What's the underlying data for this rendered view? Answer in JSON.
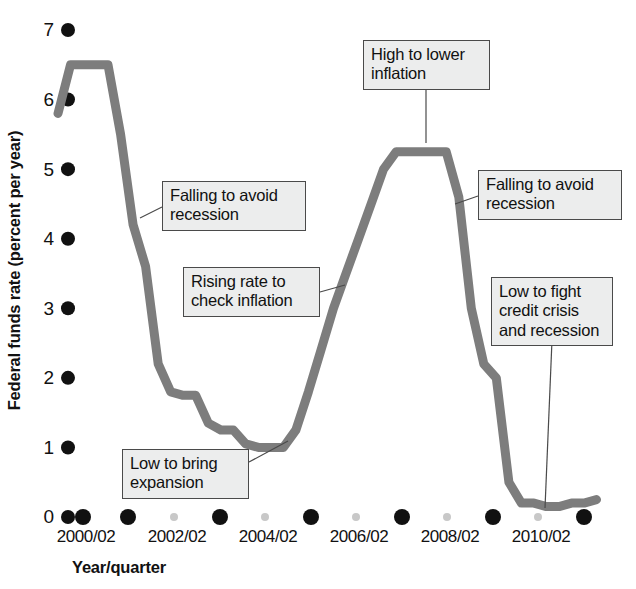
{
  "chart_data": {
    "type": "line",
    "title": "",
    "xlabel": "Year/quarter",
    "ylabel": "Federal funds rate (percent per year)",
    "ylim": [
      0,
      7
    ],
    "ytick_labels": [
      "0",
      "1",
      "2",
      "3",
      "4",
      "5",
      "6",
      "7"
    ],
    "ytick_values": [
      0,
      1,
      2,
      3,
      4,
      5,
      6,
      7
    ],
    "xtick_labels": [
      "2000/02",
      "2002/02",
      "2004/02",
      "2006/02",
      "2008/02",
      "2010/02"
    ],
    "xtick_values": [
      2000.25,
      2002.25,
      2004.25,
      2006.25,
      2008.25,
      2010.25
    ],
    "grid": false,
    "legend": null,
    "series": [
      {
        "name": "Federal funds rate",
        "color": "#7d7d7d",
        "x": [
          1999.75,
          2000.0,
          2000.25,
          2000.5,
          2000.75,
          2001.0,
          2001.25,
          2001.5,
          2001.75,
          2002.0,
          2002.25,
          2002.5,
          2002.75,
          2003.0,
          2003.25,
          2003.5,
          2003.75,
          2004.0,
          2004.25,
          2004.5,
          2004.75,
          2005.0,
          2005.25,
          2005.5,
          2005.75,
          2006.0,
          2006.25,
          2006.5,
          2006.75,
          2007.0,
          2007.25,
          2007.5,
          2007.75,
          2008.0,
          2008.25,
          2008.5,
          2008.75,
          2009.0,
          2009.25,
          2009.5,
          2009.75,
          2010.0,
          2010.25,
          2010.5
        ],
        "y": [
          5.8,
          6.5,
          6.5,
          6.5,
          6.5,
          5.5,
          4.2,
          3.6,
          2.2,
          1.8,
          1.75,
          1.75,
          1.35,
          1.25,
          1.25,
          1.05,
          1.0,
          1.0,
          1.0,
          1.25,
          1.8,
          2.4,
          3.0,
          3.5,
          4.0,
          4.5,
          5.0,
          5.25,
          5.25,
          5.25,
          5.25,
          5.25,
          4.6,
          3.0,
          2.2,
          2.0,
          0.5,
          0.2,
          0.2,
          0.15,
          0.15,
          0.2,
          0.2,
          0.25
        ]
      }
    ],
    "annotations": [
      {
        "id": "falling-to-avoid-recession-1",
        "text_lines": [
          "Falling to avoid",
          "recession"
        ],
        "points_to_x": 2001.15,
        "points_to_y": 4.55
      },
      {
        "id": "rising-rate-to-check-inflation",
        "text_lines": [
          "Rising rate to",
          "check inflation"
        ],
        "points_to_x": 2005.1,
        "points_to_y": 2.8
      },
      {
        "id": "high-to-lower-inflation",
        "text_lines": [
          "High to lower",
          "inflation"
        ],
        "points_to_x": 2006.55,
        "points_to_y": 5.3
      },
      {
        "id": "falling-to-avoid-recession-2",
        "text_lines": [
          "Falling to avoid",
          "recession"
        ],
        "points_to_x": 2007.95,
        "points_to_y": 4.45
      },
      {
        "id": "low-to-fight-credit-crisis-and-recession",
        "text_lines": [
          "Low to fight",
          "credit crisis",
          "and recession"
        ],
        "points_to_x": 2009.6,
        "points_to_y": 0.18
      },
      {
        "id": "low-to-bring-expansion",
        "text_lines": [
          "Low to bring",
          "expansion"
        ],
        "points_to_x": 2004.05,
        "points_to_y": 1.0
      }
    ]
  },
  "axes": {
    "y_ticks": [
      {
        "label": "7",
        "top": 19
      },
      {
        "label": "6",
        "top": 89
      },
      {
        "label": "5",
        "top": 159
      },
      {
        "label": "4",
        "top": 228
      },
      {
        "label": "3",
        "top": 298
      },
      {
        "label": "2",
        "top": 367
      },
      {
        "label": "1",
        "top": 437
      },
      {
        "label": "0",
        "top": 506
      }
    ],
    "x_ticks": [
      {
        "label": "2000/02",
        "left": 38
      },
      {
        "label": "2002/02",
        "left": 129
      },
      {
        "label": "2004/02",
        "left": 220
      },
      {
        "label": "2006/02",
        "left": 311
      },
      {
        "label": "2008/02",
        "left": 402
      },
      {
        "label": "2010/02",
        "left": 493
      }
    ]
  },
  "annotation_boxes": [
    {
      "id": "falling-to-avoid-recession-1",
      "left": 162,
      "top": 181,
      "width": 144,
      "lines": [
        "Falling to avoid",
        "recession"
      ]
    },
    {
      "id": "rising-rate-to-check-inflation",
      "left": 183,
      "top": 267,
      "width": 137,
      "lines": [
        "Rising rate to",
        "check inflation"
      ]
    },
    {
      "id": "high-to-lower-inflation",
      "left": 363,
      "top": 40,
      "width": 127,
      "lines": [
        "High to lower",
        "inflation"
      ]
    },
    {
      "id": "falling-to-avoid-recession-2",
      "left": 478,
      "top": 170,
      "width": 144,
      "lines": [
        "Falling to avoid",
        "recession"
      ]
    },
    {
      "id": "low-to-fight-credit-crisis-and-recession",
      "left": 491,
      "top": 277,
      "width": 122,
      "lines": [
        "Low to fight",
        "credit crisis",
        "and recession"
      ]
    },
    {
      "id": "low-to-bring-expansion",
      "left": 122,
      "top": 449,
      "width": 127,
      "lines": [
        "Low to bring",
        "expansion"
      ]
    }
  ],
  "leader_lines": [
    {
      "id": "leader-falling-1",
      "x1": 162,
      "y1": 207,
      "x2": 140,
      "y2": 218
    },
    {
      "id": "leader-rising",
      "x1": 320,
      "y1": 292,
      "x2": 345,
      "y2": 285
    },
    {
      "id": "leader-high",
      "x1": 426,
      "y1": 80,
      "x2": 426,
      "y2": 143
    },
    {
      "id": "leader-falling-2",
      "x1": 478,
      "y1": 196,
      "x2": 455,
      "y2": 204
    },
    {
      "id": "leader-credit",
      "x1": 552,
      "y1": 340,
      "x2": 545,
      "y2": 508
    },
    {
      "id": "leader-low-expansion",
      "x1": 249,
      "y1": 462,
      "x2": 288,
      "y2": 441
    }
  ],
  "x_axis_dots": {
    "major_color": "#111111",
    "minor_color": "#c8c8c8",
    "major_positions": [
      83,
      128,
      220,
      311,
      402,
      493,
      584
    ],
    "minor_positions": [
      174,
      265,
      356,
      447,
      538
    ]
  }
}
